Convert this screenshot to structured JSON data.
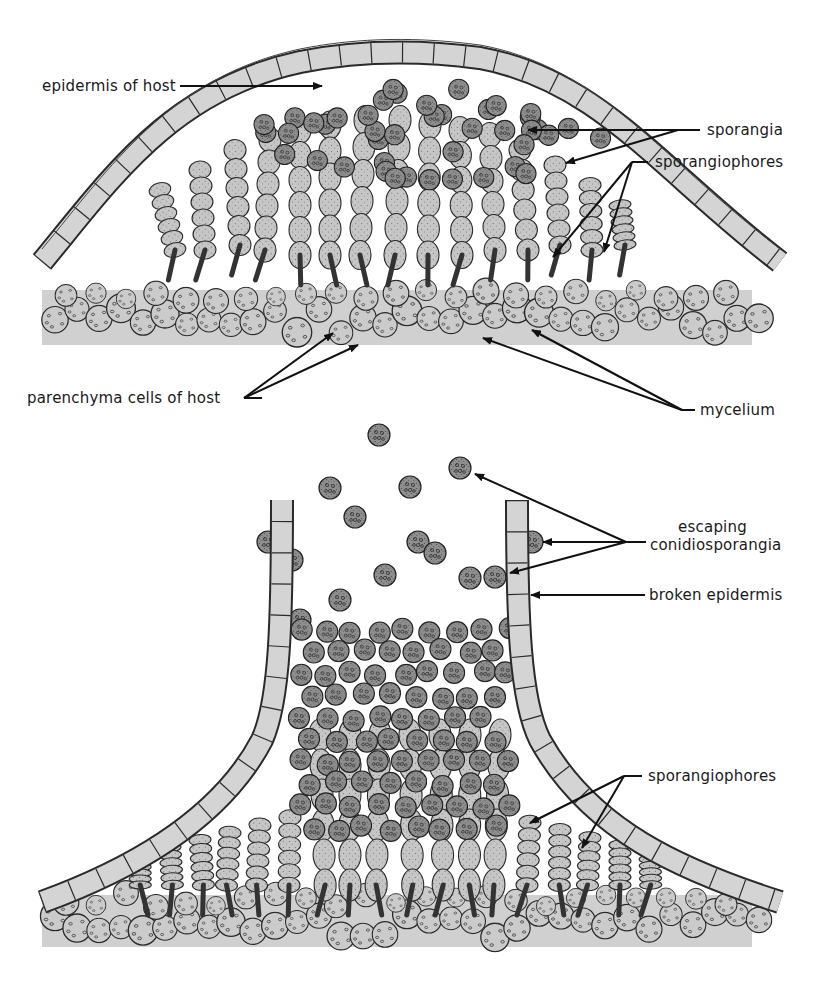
{
  "figure": {
    "panels": [
      {
        "id": "top",
        "description": "Intact pustule: sporangiophores and sporangia developing beneath host epidermis",
        "labels": {
          "epidermis": "epidermis of host",
          "sporangia": "sporangia",
          "sporangiophores": "sporangiophores",
          "parenchyma": "parenchyma cells of host",
          "mycelium": "mycelium"
        }
      },
      {
        "id": "bottom",
        "description": "Ruptured pustule: conidiosporangia escaping through broken epidermis",
        "labels": {
          "escaping_line1": "escaping",
          "escaping_line2": "conidiosporangia",
          "broken_epidermis": "broken epidermis",
          "sporangiophores": "sporangiophores"
        }
      }
    ],
    "colors": {
      "background": "#ffffff",
      "epidermis_cell": "#d4d4d4",
      "sporangium": "#8f8f8f",
      "sporangiophore": "#c2c2c2",
      "parenchyma": "#cacaca",
      "outline": "#2a2a2a",
      "text": "#1a1a1a"
    }
  }
}
